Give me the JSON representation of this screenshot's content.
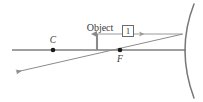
{
  "figure": {
    "labels": {
      "object": "Object",
      "center_of_curvature": "C",
      "focal_point": "F",
      "ray_marker": "1"
    },
    "colors": {
      "axis": "#808080",
      "ray": "#8c8c8c",
      "object_arrow": "#8a8a8a",
      "mirror": "#777777",
      "point_dot": "#1a1a1a",
      "text": "#3a3a3a",
      "background": "#ffffff",
      "box_border": "#6b6b6b"
    },
    "geometry": {
      "optical_axis_y": 50,
      "optical_axis_x_start": 12,
      "optical_axis_x_end": 186,
      "center_of_curvature_x": 53,
      "focal_point_x": 120,
      "object_base_x": 97,
      "object_top_y": 32,
      "mirror_vertex_x": 182,
      "mirror_top_x": 194,
      "mirror_top_y": 4,
      "mirror_bottom_x": 194,
      "mirror_bottom_y": 98,
      "incident_ray_y": 34,
      "incident_ray_x_start": 97,
      "incident_ray_x_end": 182,
      "reflected_ray_arrow_x": 14,
      "reflected_ray_arrow_y": 73
    }
  }
}
